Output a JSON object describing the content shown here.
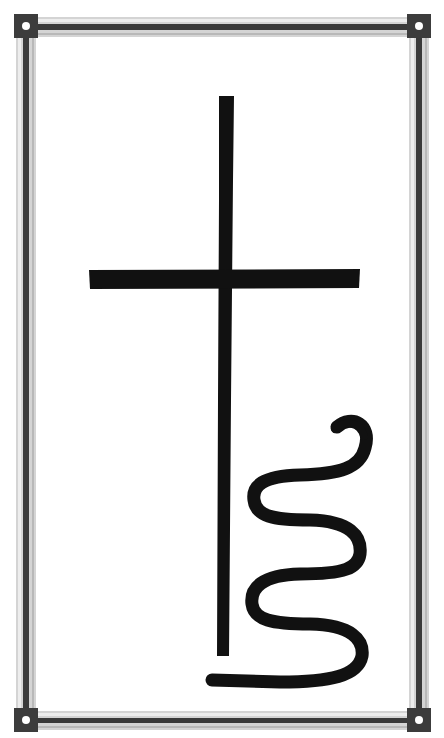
{
  "image": {
    "subject": "cross-with-serpent-symbol",
    "background_color": "#ffffff",
    "ink_color": "#111111"
  },
  "frame": {
    "outer_light": "#c8c8c8",
    "inner_dark": "#3a3a3a",
    "corner_fill": "#3c3c3c",
    "corner_dot": "#ffffff"
  }
}
